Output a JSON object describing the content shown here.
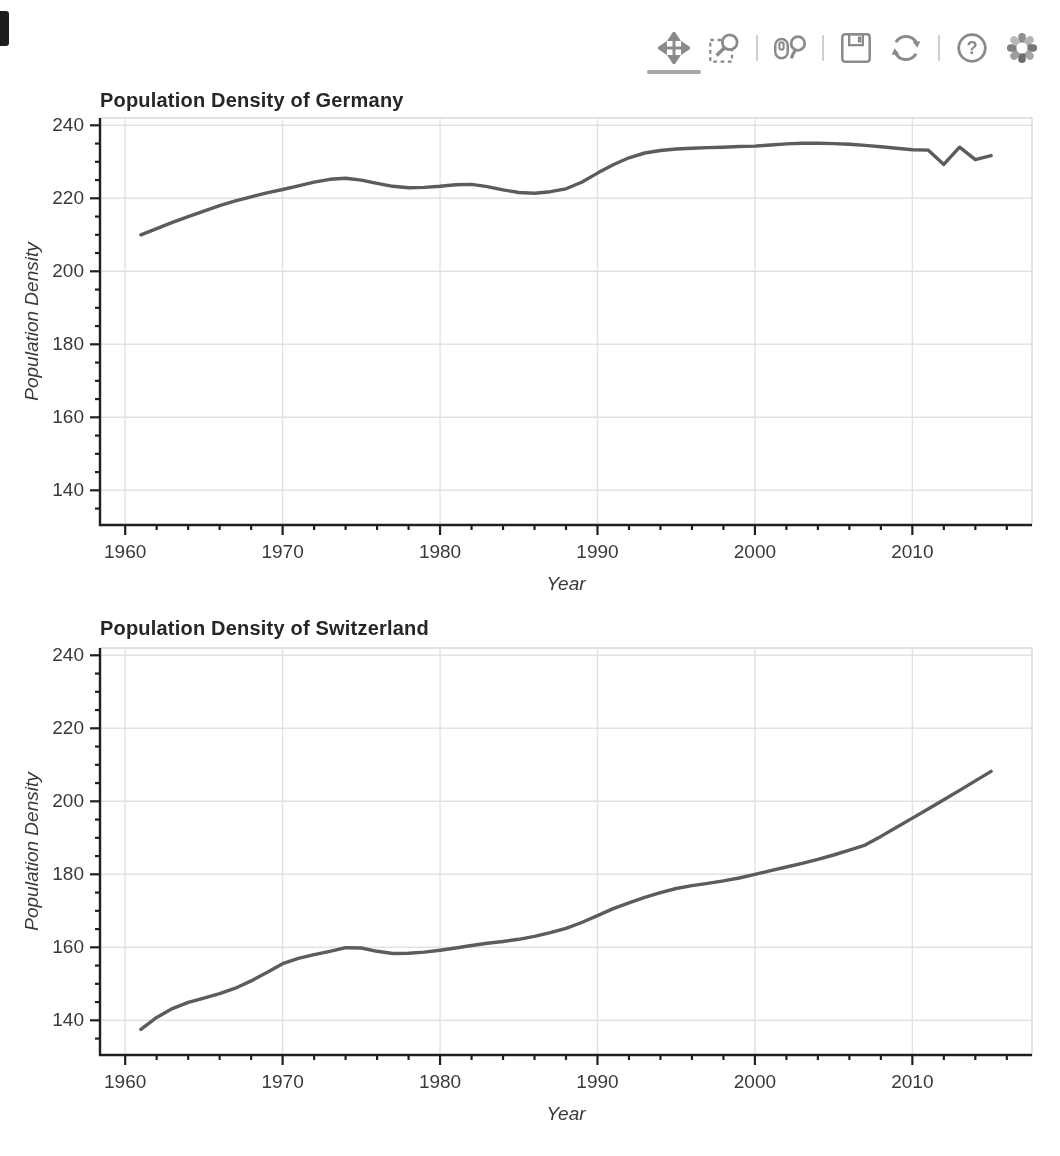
{
  "toolbar": {
    "help_glyph": "?",
    "icon_color": "#8a8a8a",
    "active_underline_color": "#a6a6a6",
    "tools": [
      {
        "name": "pan",
        "label": "Pan",
        "active": true
      },
      {
        "name": "box-zoom",
        "label": "Box Zoom",
        "active": false
      },
      {
        "name": "wheel-zoom",
        "label": "Wheel Zoom",
        "active": false
      },
      {
        "name": "save",
        "label": "Save",
        "active": false
      },
      {
        "name": "reset",
        "label": "Reset",
        "active": false
      },
      {
        "name": "help",
        "label": "Help",
        "active": false
      },
      {
        "name": "bokeh-logo",
        "label": "Bokeh",
        "active": false
      }
    ]
  },
  "colors": {
    "line": "#5c5c5c",
    "grid": "#e2e2e2",
    "axis": "#1f1f1f",
    "tick_label": "#3a3a3a",
    "title": "#262626",
    "background": "#ffffff"
  },
  "chart_data": [
    {
      "type": "line",
      "title": "Population Density of Germany",
      "series_name": "germany-population-density",
      "xlabel": "Year",
      "ylabel": "Population Density",
      "xlim": [
        1958.4,
        2017.6
      ],
      "ylim": [
        130.5,
        242
      ],
      "x_major_ticks": [
        1960,
        1970,
        1980,
        1990,
        2000,
        2010
      ],
      "y_major_ticks": [
        140,
        160,
        180,
        200,
        220,
        240
      ],
      "x_minor_step": 2,
      "y_minor_step": 5,
      "grid": true,
      "legend": "none",
      "line_color": "#5c5c5c",
      "x": [
        1961,
        1962,
        1963,
        1964,
        1965,
        1966,
        1967,
        1968,
        1969,
        1970,
        1971,
        1972,
        1973,
        1974,
        1975,
        1976,
        1977,
        1978,
        1979,
        1980,
        1981,
        1982,
        1983,
        1984,
        1985,
        1986,
        1987,
        1988,
        1989,
        1990,
        1991,
        1992,
        1993,
        1994,
        1995,
        1996,
        1997,
        1998,
        1999,
        2000,
        2001,
        2002,
        2003,
        2004,
        2005,
        2006,
        2007,
        2008,
        2009,
        2010,
        2011,
        2012,
        2013,
        2014,
        2015
      ],
      "y": [
        210.0,
        211.7,
        213.4,
        215.0,
        216.5,
        218.0,
        219.3,
        220.4,
        221.5,
        222.4,
        223.4,
        224.4,
        225.2,
        225.5,
        225.0,
        224.1,
        223.3,
        222.9,
        223.0,
        223.3,
        223.7,
        223.8,
        223.2,
        222.3,
        221.6,
        221.4,
        221.8,
        222.6,
        224.4,
        226.9,
        229.2,
        231.1,
        232.4,
        233.1,
        233.5,
        233.7,
        233.9,
        234.0,
        234.2,
        234.3,
        234.6,
        234.9,
        235.1,
        235.1,
        235.0,
        234.8,
        234.5,
        234.1,
        233.7,
        233.3,
        233.2,
        229.3,
        234.0,
        230.6,
        231.7
      ]
    },
    {
      "type": "line",
      "title": "Population Density of Switzerland",
      "series_name": "switzerland-population-density",
      "xlabel": "Year",
      "ylabel": "Population Density",
      "xlim": [
        1958.4,
        2017.6
      ],
      "ylim": [
        130.5,
        242
      ],
      "x_major_ticks": [
        1960,
        1970,
        1980,
        1990,
        2000,
        2010
      ],
      "y_major_ticks": [
        140,
        160,
        180,
        200,
        220,
        240
      ],
      "x_minor_step": 2,
      "y_minor_step": 5,
      "grid": true,
      "legend": "none",
      "line_color": "#5c5c5c",
      "x": [
        1961,
        1962,
        1963,
        1964,
        1965,
        1966,
        1967,
        1968,
        1969,
        1970,
        1971,
        1972,
        1973,
        1974,
        1975,
        1976,
        1977,
        1978,
        1979,
        1980,
        1981,
        1982,
        1983,
        1984,
        1985,
        1986,
        1987,
        1988,
        1989,
        1990,
        1991,
        1992,
        1993,
        1994,
        1995,
        1996,
        1997,
        1998,
        1999,
        2000,
        2001,
        2002,
        2003,
        2004,
        2005,
        2006,
        2007,
        2008,
        2009,
        2010,
        2011,
        2012,
        2013,
        2014,
        2015
      ],
      "y": [
        137.5,
        140.8,
        143.2,
        144.9,
        146.1,
        147.3,
        148.8,
        150.8,
        153.1,
        155.5,
        157.0,
        158.0,
        158.9,
        159.9,
        159.8,
        158.9,
        158.3,
        158.4,
        158.7,
        159.2,
        159.8,
        160.5,
        161.1,
        161.6,
        162.2,
        163.0,
        164.0,
        165.2,
        166.8,
        168.7,
        170.6,
        172.2,
        173.7,
        175.0,
        176.1,
        176.9,
        177.5,
        178.2,
        179.0,
        180.0,
        181.0,
        182.0,
        183.0,
        184.1,
        185.3,
        186.6,
        188.0,
        190.4,
        192.9,
        195.4,
        197.9,
        200.4,
        203.0,
        205.6,
        208.2
      ]
    }
  ]
}
